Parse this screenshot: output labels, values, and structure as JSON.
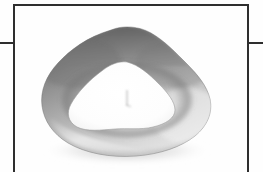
{
  "plate": {
    "background_color": "#fefefe",
    "ink_color": "#2e2e2e",
    "frame": {
      "name": "plate-frame",
      "border_color": "#2e2e2e",
      "border_width_px": 2,
      "left_px": 13,
      "top_px": 4,
      "right_px": 249,
      "open_bottom": true
    },
    "crop_marks": [
      {
        "side": "left",
        "y_px": 42,
        "length_px": 14
      },
      {
        "side": "right",
        "y_px": 42,
        "length_px": 15
      }
    ]
  },
  "specimen": {
    "label": "anatomical cross-section",
    "description": "halftone-printed transverse section of a tubular organ showing a thick rounded pentagonal wall surrounding a bright central lumen",
    "print_technique": "halftone dot screen",
    "ink_color": "#2e2e2e",
    "outer_wall": {
      "name": "specimen-outer-wall",
      "shading": "graduated, darkest along the upper and upper-left margin, lightest along the lower-right",
      "tone_dark": "#7a7a7a",
      "tone_mid": "#a8a8a8",
      "tone_light": "#d8d8d8"
    },
    "lumen": {
      "name": "specimen-lumen",
      "fill": "#fdfdfd",
      "rim_tone": "#8d8d8d",
      "description": "bright irregular pentagonal central cavity"
    },
    "center_mark": {
      "name": "specimen-center-detail",
      "description": "small faint vertical tick with a hook at its base near the middle of the lumen",
      "tone": "#9a9a9a"
    },
    "cast_shadow": {
      "name": "specimen-cast-shadow",
      "description": "soft diffuse shadow fading beneath the lower margin of the section",
      "tone": "#c4c4c4"
    }
  }
}
